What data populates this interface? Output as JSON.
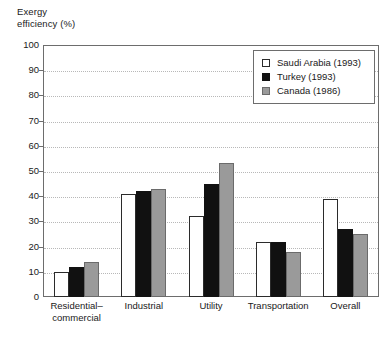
{
  "chart_data": {
    "type": "bar",
    "title": "",
    "xlabel": "",
    "ylabel": "Exergy\nefficiency (%)",
    "ylim": [
      0,
      100
    ],
    "ytick_step": 10,
    "yticks": [
      "0",
      "10",
      "20",
      "30",
      "40",
      "50",
      "60",
      "70",
      "80",
      "90",
      "100"
    ],
    "grid": "horizontal-dotted",
    "legend_position": "top-right-inside",
    "categories": [
      "Residential–\ncommercial",
      "Industrial",
      "Utility",
      "Transportation",
      "Overall"
    ],
    "series": [
      {
        "name": "Saudi Arabia (1993)",
        "swatch": "open-square",
        "color": "#ffffff",
        "edge_color": "#2b2b2b",
        "values": [
          10,
          41,
          32,
          22,
          39
        ]
      },
      {
        "name": "Turkey (1993)",
        "swatch": "filled-square",
        "color": "#111111",
        "edge_color": "#111111",
        "values": [
          12,
          42,
          45,
          22,
          27
        ]
      },
      {
        "name": "Canada (1986)",
        "swatch": "gray-square",
        "color": "#9a9a9a",
        "edge_color": "#6b6b6b",
        "values": [
          14,
          43,
          53,
          18,
          25
        ]
      }
    ]
  },
  "figure": {
    "background_color": "#ffffff",
    "axis_color": "#6d6d6d",
    "gridline_color": "#b8b8b8",
    "text_color": "#1a1a1a"
  }
}
